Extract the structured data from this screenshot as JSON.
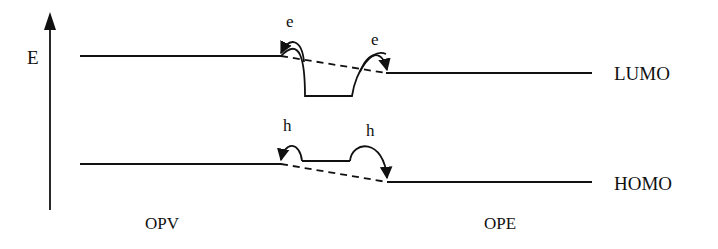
{
  "diagram": {
    "axis_label": "E",
    "levels": {
      "lumo": "LUMO",
      "homo": "HOMO"
    },
    "materials": {
      "left": "OPV",
      "right": "OPE"
    },
    "carriers": {
      "electron_1": "e",
      "electron_2": "e",
      "hole_1": "h",
      "hole_2": "h"
    },
    "colors": {
      "line": "#111111",
      "background": "#ffffff"
    }
  }
}
